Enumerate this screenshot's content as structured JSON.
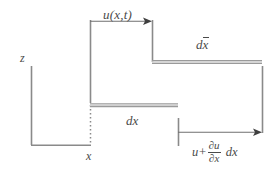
{
  "figure": {
    "background_color": "#ffffff",
    "line_color": "#8a8a8a",
    "text_color": "#4a4a4a",
    "width": 278,
    "height": 174,
    "labels": {
      "displacement": "u(x,t)",
      "deformed_length_d": "d",
      "deformed_length_xbar": "x",
      "undeformed_length": "dx",
      "vertical_axis": "z",
      "origin_position": "x",
      "flux_u": "u",
      "flux_plus": "+",
      "flux_numerator": "∂u",
      "flux_denominator": "∂x",
      "flux_dx": "dx"
    },
    "elements": [
      {
        "name": "displacement-arrow",
        "type": "arrow",
        "from_x": 90,
        "to_x": 152,
        "y": 21,
        "label": "u(x,t)"
      },
      {
        "name": "left-reference-line",
        "type": "vertical-line",
        "x": 90,
        "y1": 20,
        "y2": 103
      },
      {
        "name": "displaced-left-end-line",
        "type": "vertical-line",
        "x": 152,
        "y1": 20,
        "y2": 62
      },
      {
        "name": "deformed-element-bar",
        "type": "double-bar",
        "x1": 152,
        "x2": 262,
        "y": 62,
        "label": "dx-bar"
      },
      {
        "name": "undeformed-element-bar",
        "type": "double-bar",
        "x1": 90,
        "x2": 178,
        "y": 105,
        "label": "dx"
      },
      {
        "name": "right-displacement-arrow",
        "type": "arrow",
        "from_x": 178,
        "to_x": 262,
        "y": 132,
        "label": "u + du/dx dx"
      },
      {
        "name": "right-reference-line",
        "type": "vertical-line",
        "x": 178,
        "y1": 118,
        "y2": 146
      },
      {
        "name": "displaced-right-end-line",
        "type": "vertical-line",
        "x": 262,
        "y1": 66,
        "y2": 133
      },
      {
        "name": "z-axis",
        "type": "vertical-line",
        "x": 31,
        "y1": 66,
        "y2": 145
      },
      {
        "name": "x-axis",
        "type": "horizontal-line",
        "x1": 31,
        "x2": 90,
        "y": 145
      },
      {
        "name": "origin-dotted-line",
        "type": "dotted-vertical-line",
        "x": 90,
        "y1": 105,
        "y2": 145
      }
    ]
  }
}
